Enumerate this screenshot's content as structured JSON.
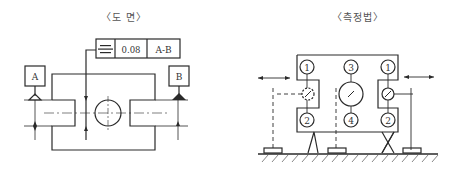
{
  "left_panel": {
    "title": "〈도  면〉",
    "feature_control_frame": {
      "symbol": "symmetry",
      "tolerance": "0.08",
      "datum": "A-B"
    },
    "datums": [
      "A",
      "B"
    ]
  },
  "right_panel": {
    "title": "〈측정법〉",
    "labels": {
      "top_left": "1",
      "top_center": "3",
      "top_right": "1",
      "bottom_left": "2",
      "bottom_center": "4",
      "bottom_right": "2"
    }
  },
  "colors": {
    "line": "#2a2a2a",
    "background": "#ffffff"
  }
}
